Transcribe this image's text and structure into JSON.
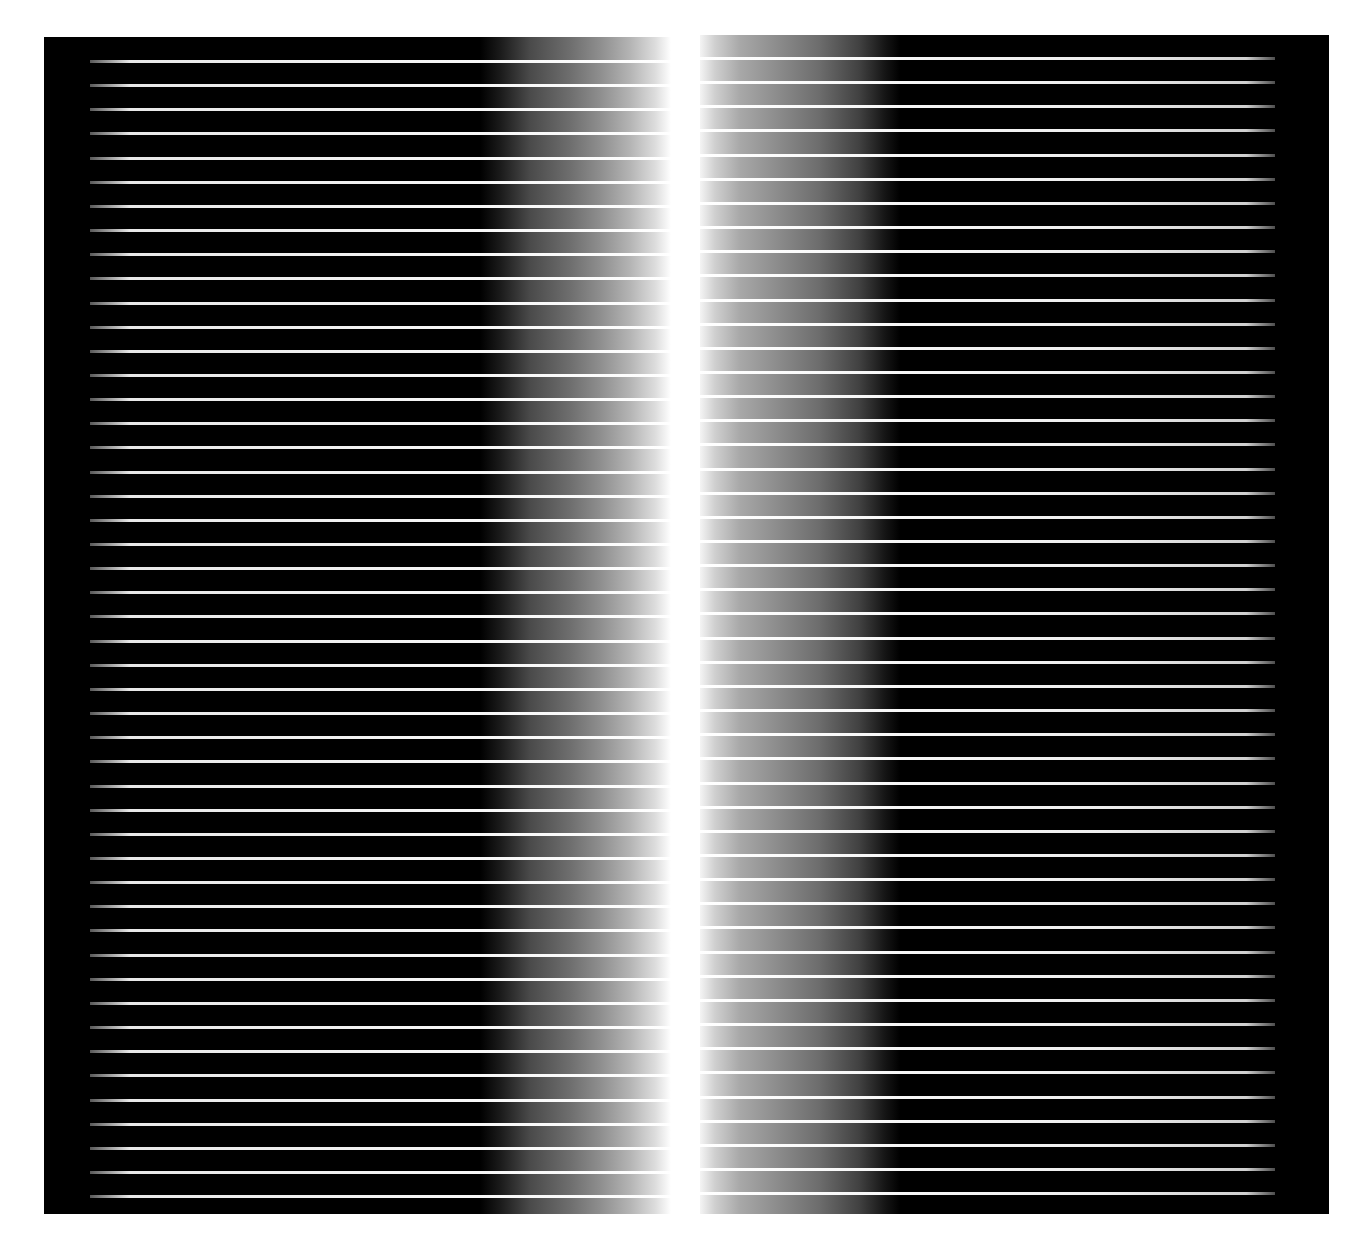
{
  "image": {
    "description": "Abstract striped panels with central white gradient glow",
    "background_color": "#ffffff",
    "panel_color": "#000000",
    "line_color": "#ffffff"
  },
  "panels": [
    {
      "name": "left-panel",
      "x": 44,
      "y": 37,
      "width": 627,
      "height": 1177,
      "gradient_direction": "black-to-white-rightward",
      "first_line_y": 23,
      "line_spacing": 24.15,
      "line_count": 48
    },
    {
      "name": "right-panel",
      "x": 700,
      "y": 35,
      "width": 629,
      "height": 1179,
      "gradient_direction": "white-to-black-rightward",
      "first_line_y": 22,
      "line_spacing": 24.15,
      "line_count": 48
    }
  ]
}
